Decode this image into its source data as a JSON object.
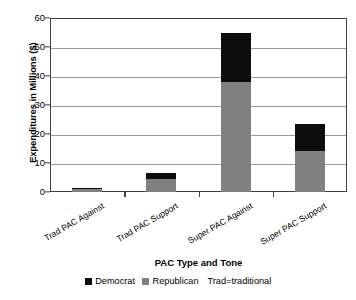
{
  "chart_data": {
    "type": "bar",
    "subtype": "stacked-bar",
    "title": "",
    "xlabel": "PAC Type and Tone",
    "ylabel": "Expenditures in Millions ($)",
    "categories": [
      "Trad PAC Against",
      "Trad PAC Support",
      "Super PAC Against",
      "Super PAC Support"
    ],
    "series": [
      {
        "name": "Republican",
        "color": "#808080",
        "values": [
          1.0,
          4.5,
          38.0,
          14.0
        ]
      },
      {
        "name": "Democrat",
        "color": "#0d0d0d",
        "values": [
          0.3,
          2.0,
          17.0,
          9.5
        ]
      }
    ],
    "totals": [
      1.3,
      6.5,
      55.0,
      23.5
    ],
    "ylim": [
      0,
      60
    ],
    "yticks": [
      0,
      10,
      20,
      30,
      40,
      50,
      60
    ],
    "ytick_labels": [
      "0",
      "10",
      "20",
      "30",
      "40",
      "50",
      "60"
    ],
    "grid": "horizontal",
    "legend_position": "bottom",
    "legend": [
      {
        "label": "Democrat",
        "color": "#0d0d0d"
      },
      {
        "label": "Republican",
        "color": "#808080"
      }
    ],
    "annotations": [
      "Trad=traditional"
    ],
    "stack_order": "Republican bottom, Democrat top"
  },
  "axes": {
    "y_title": "Expenditures in Millions ($)",
    "x_title": "PAC Type and Tone"
  },
  "legend": {
    "democrat_label": "Democrat",
    "republican_label": "Republican",
    "note": "Trad=traditional"
  }
}
